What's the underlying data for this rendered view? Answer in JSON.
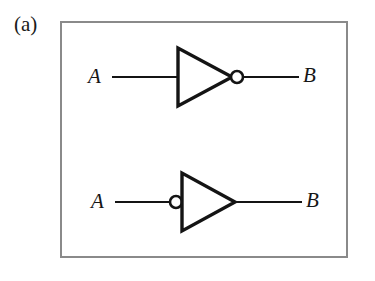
{
  "figure": {
    "panel_label": "(a)",
    "background_color": "#ffffff",
    "border_color": "#8a8a8a",
    "ink_color": "#141414"
  },
  "circuits": [
    {
      "id": "inverter-output-bubble",
      "gate_type": "NOT",
      "name": "inverter with output inversion bubble",
      "bubble_side": "output",
      "input_label": "A",
      "output_label": "B"
    },
    {
      "id": "inverter-input-bubble",
      "gate_type": "NOT",
      "name": "inverter with input inversion bubble",
      "bubble_side": "input",
      "input_label": "A",
      "output_label": "B"
    }
  ],
  "labels": {
    "top_input": "A",
    "top_output": "B",
    "bottom_input": "A",
    "bottom_output": "B"
  }
}
